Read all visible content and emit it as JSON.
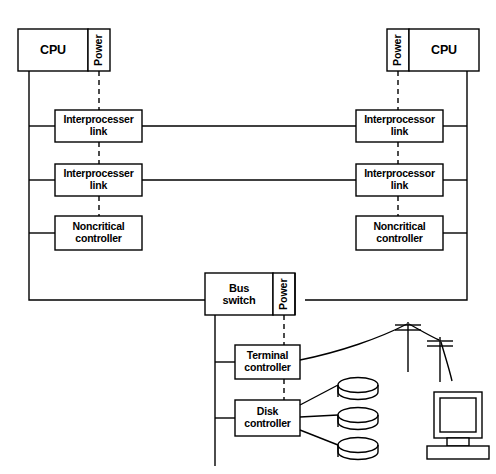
{
  "diagram": {
    "style": {
      "line_color": "#000000",
      "box_fill": "#ffffff",
      "background": "#ffffff"
    },
    "nodes": {
      "cpu_left": {
        "label": "CPU"
      },
      "power_left": {
        "label": "Power"
      },
      "cpu_right": {
        "label": "CPU"
      },
      "power_right": {
        "label": "Power"
      },
      "link_left_1": {
        "label_line1": "Interprocesser",
        "label_line2": "link"
      },
      "link_left_2": {
        "label_line1": "Interprocesser",
        "label_line2": "link"
      },
      "link_right_1": {
        "label_line1": "Interprocessor",
        "label_line2": "link"
      },
      "link_right_2": {
        "label_line1": "Interprocessor",
        "label_line2": "link"
      },
      "noncritical_left": {
        "label_line1": "Noncritical",
        "label_line2": "controller"
      },
      "noncritical_right": {
        "label_line1": "Noncritical",
        "label_line2": "controller"
      },
      "bus_switch": {
        "label_line1": "Bus",
        "label_line2": "switch"
      },
      "power_bus": {
        "label": "Power"
      },
      "terminal_controller": {
        "label_line1": "Terminal",
        "label_line2": "controller"
      },
      "disk_controller": {
        "label_line1": "Disk",
        "label_line2": "controller"
      }
    },
    "peripherals": {
      "disks": [
        "disk-platter-1",
        "disk-platter-2",
        "disk-platter-3"
      ],
      "terminal": "terminal-monitor",
      "poles": [
        "utility-pole-1",
        "utility-pole-2"
      ]
    }
  }
}
